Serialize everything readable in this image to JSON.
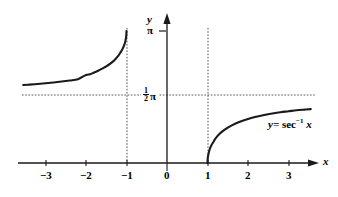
{
  "chart_data": {
    "type": "line",
    "title": "",
    "xlabel": "x",
    "ylabel": "y",
    "equation_label": "y= sec",
    "equation_exponent": "-1",
    "equation_variable": "x",
    "xlim": [
      -3.6,
      3.6
    ],
    "ylim": [
      -0.25,
      3.45
    ],
    "grid": false,
    "legend_position": "inline-right",
    "x_ticks": [
      "-3",
      "-2",
      "-1",
      "0",
      "1",
      "2",
      "3"
    ],
    "x_tick_values": [
      -3,
      -2,
      -1,
      0,
      1,
      2,
      3
    ],
    "y_ticks": [
      {
        "label": "pi",
        "display": "π",
        "value": 3.14159
      },
      {
        "label": "half-pi",
        "numerator": "1",
        "denominator": "2",
        "symbol": "π",
        "value": 1.5708
      }
    ],
    "asymptotes": [
      {
        "kind": "vertical",
        "at": -1,
        "style": "dotted",
        "label": "x = -1"
      },
      {
        "kind": "vertical",
        "at": 1,
        "style": "dotted",
        "label": "x = 1"
      },
      {
        "kind": "horizontal",
        "at": 1.5708,
        "style": "dotted",
        "label": "y = pi/2"
      }
    ],
    "series": [
      {
        "name": "left-branch",
        "domain": [
          -3.55,
          -1.0
        ],
        "points": [
          [
            -3.55,
            1.8555
          ],
          [
            -3.4,
            1.8657
          ],
          [
            -3.2,
            1.8807
          ],
          [
            -3.0,
            1.8976
          ],
          [
            -2.8,
            1.9166
          ],
          [
            -2.6,
            1.9384
          ],
          [
            -2.4,
            1.9635
          ],
          [
            -2.2,
            1.9929
          ],
          [
            -2.0,
            2.0944
          ],
          [
            -1.9,
            2.1112
          ],
          [
            -1.8,
            2.1532
          ],
          [
            -1.7,
            2.195
          ],
          [
            -1.6,
            2.248
          ],
          [
            -1.5,
            2.3005
          ],
          [
            -1.4,
            2.3664
          ],
          [
            -1.3,
            2.4482
          ],
          [
            -1.2,
            2.5559
          ],
          [
            -1.15,
            2.628
          ],
          [
            -1.1,
            2.71
          ],
          [
            -1.06,
            2.797
          ],
          [
            -1.03,
            2.888
          ],
          [
            -1.012,
            2.986
          ],
          [
            -1.004,
            3.054
          ],
          [
            -1.0,
            3.14159
          ]
        ]
      },
      {
        "name": "right-branch",
        "domain": [
          1.0,
          3.55
        ],
        "points": [
          [
            1.0,
            0.0
          ],
          [
            1.004,
            0.0894
          ],
          [
            1.012,
            0.1547
          ],
          [
            1.03,
            0.2437
          ],
          [
            1.06,
            0.344
          ],
          [
            1.1,
            0.4297
          ],
          [
            1.15,
            0.5054
          ],
          [
            1.2,
            0.5857
          ],
          [
            1.3,
            0.6935
          ],
          [
            1.4,
            0.7752
          ],
          [
            1.5,
            0.8411
          ],
          [
            1.6,
            0.8957
          ],
          [
            1.8,
            0.9826
          ],
          [
            2.0,
            1.0472
          ],
          [
            2.2,
            1.1002
          ],
          [
            2.4,
            1.1428
          ],
          [
            2.6,
            1.1786
          ],
          [
            2.8,
            1.2087
          ],
          [
            3.0,
            1.231
          ],
          [
            3.2,
            1.2546
          ],
          [
            3.4,
            1.2707
          ],
          [
            3.55,
            1.2825
          ]
        ]
      }
    ]
  },
  "axes": {
    "x_axis_name": "x",
    "y_axis_name": "y",
    "x_tick_labels": [
      {
        "text": "−3",
        "value": -3
      },
      {
        "text": "−2",
        "value": -2
      },
      {
        "text": "−1",
        "value": -1
      },
      {
        "text": "0",
        "value": 0
      },
      {
        "text": "1",
        "value": 1
      },
      {
        "text": "2",
        "value": 2
      },
      {
        "text": "3",
        "value": 3
      }
    ],
    "pi_label": "π",
    "half_pi_numerator": "1",
    "half_pi_denominator": "2",
    "half_pi_symbol": "π"
  },
  "annotation": {
    "curve_label_prefix": "y=",
    "curve_label_function": "sec",
    "curve_label_superscript": "−1",
    "curve_label_argument": "x"
  },
  "colors": {
    "ink": "#000000",
    "background": "#ffffff",
    "curve": "#1a1a1a",
    "dotted": "#555555"
  }
}
